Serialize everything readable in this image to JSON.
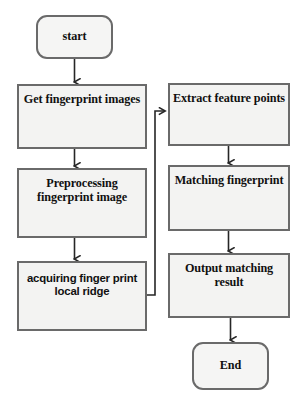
{
  "diagram": {
    "background_color": "#ffffff",
    "node_fill_color": "#f3f3f2",
    "node_border_color": "#6a6a6a",
    "connector_color": "#262626",
    "text_color": "#101010"
  },
  "nodes": {
    "start": {
      "label": "start",
      "shape": "terminator"
    },
    "get_images": {
      "label": "Get fingerprint images",
      "shape": "process"
    },
    "preprocessing": {
      "label": "Preprocessing fingerprint image",
      "shape": "process"
    },
    "acquiring": {
      "label": "acquiring finger print local ridge",
      "shape": "process"
    },
    "extract": {
      "label": "Extract feature points",
      "shape": "process"
    },
    "matching": {
      "label": "Matching fingerprint",
      "shape": "process"
    },
    "output": {
      "label": "Output matching result",
      "shape": "process"
    },
    "end": {
      "label": "End",
      "shape": "terminator"
    }
  },
  "connections": [
    {
      "from": "start",
      "to": "get_images",
      "type": "arrow-down"
    },
    {
      "from": "get_images",
      "to": "preprocessing",
      "type": "arrow-down"
    },
    {
      "from": "preprocessing",
      "to": "acquiring",
      "type": "arrow-down"
    },
    {
      "from": "acquiring",
      "to": "extract",
      "type": "elbow-right-up-arrow-right"
    },
    {
      "from": "extract",
      "to": "matching",
      "type": "arrow-down"
    },
    {
      "from": "matching",
      "to": "output",
      "type": "arrow-down"
    },
    {
      "from": "output",
      "to": "end",
      "type": "arrow-down"
    }
  ]
}
